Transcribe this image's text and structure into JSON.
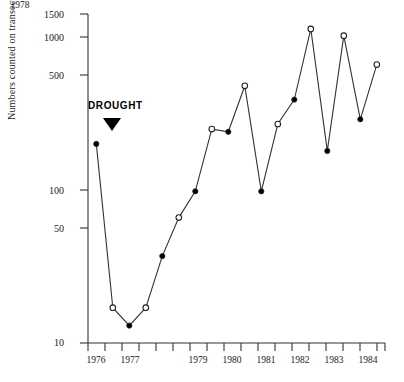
{
  "chart_data": {
    "type": "line",
    "title": "",
    "xlabel": "",
    "ylabel": "Numbers counted on transect",
    "yscale": "log",
    "ylim": [
      10,
      1500
    ],
    "ytick_values": [
      10,
      50,
      100,
      500,
      1000,
      1500
    ],
    "ytick_labels": [
      "10",
      "50",
      "100",
      "500",
      "1000",
      "1500"
    ],
    "xlim": [
      1975.75,
      1984.75
    ],
    "xtick_labels": [
      "1976",
      "1977",
      "1978",
      "1979",
      "1980",
      "1981",
      "1982",
      "1983",
      "1984"
    ],
    "xtick_values": [
      1976,
      1977,
      1978,
      1979,
      1980,
      1981,
      1982,
      1983,
      1984
    ],
    "grid": false,
    "legend": false,
    "annotations": [
      {
        "text": "DROUGHT",
        "x": 1976.4,
        "y": 300,
        "marker": "down-triangle"
      }
    ],
    "series": [
      {
        "name": "Numbers counted on transect",
        "marker_note": "alternating filled (closed) and open circles mark successive half-year censuses",
        "x": [
          1976.0,
          1976.5,
          1977.0,
          1977.5,
          1978.0,
          1978.5,
          1979.0,
          1979.5,
          1980.0,
          1980.5,
          1981.0,
          1981.5,
          1982.0,
          1982.5,
          1983.0,
          1983.5,
          1984.0,
          1984.5
        ],
        "x_labels": [
          "1976",
          "1976.5",
          "1977",
          "1977.5",
          "1978",
          "1978.5",
          "1979",
          "1979.5",
          "1980",
          "1980.5",
          "1981",
          "1981.5",
          "1982",
          "1982.5",
          "1983",
          "1983.5",
          "1984",
          "1984.5"
        ],
        "values": [
          200,
          17,
          13,
          17,
          37,
          66,
          98,
          250,
          240,
          480,
          98,
          270,
          390,
          1130,
          180,
          1020,
          290,
          660
        ],
        "markers": [
          "filled",
          "open",
          "filled",
          "open",
          "filled",
          "open",
          "filled",
          "open",
          "filled",
          "open",
          "filled",
          "open",
          "filled",
          "open",
          "filled",
          "open",
          "filled",
          "open"
        ]
      }
    ]
  },
  "axis": {
    "y_title": "Numbers counted on transect"
  },
  "annotation": {
    "drought_label": "DROUGHT"
  }
}
